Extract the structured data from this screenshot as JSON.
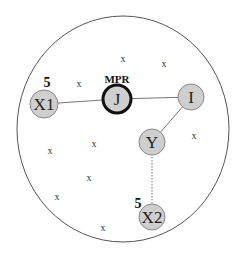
{
  "diagram": {
    "boundary": {
      "cx": 123,
      "cy": 129,
      "rx": 106,
      "ry": 113,
      "stroke": "#555555"
    },
    "nodes": [
      {
        "id": "X1",
        "label": "X1",
        "cx": 44,
        "cy": 104,
        "r": 14,
        "fill": "#cfcfcf",
        "bold": false
      },
      {
        "id": "J",
        "label": "J",
        "cx": 117,
        "cy": 99,
        "r": 14,
        "fill": "#cfcfcf",
        "bold": true
      },
      {
        "id": "I",
        "label": "I",
        "cx": 191,
        "cy": 97,
        "r": 13,
        "fill": "#cfcfcf",
        "bold": false
      },
      {
        "id": "Y",
        "label": "Y",
        "cx": 152,
        "cy": 142,
        "r": 13,
        "fill": "#cfcfcf",
        "bold": false
      },
      {
        "id": "X2",
        "label": "X2",
        "cx": 152,
        "cy": 217,
        "r": 13,
        "fill": "#cfcfcf",
        "bold": false
      }
    ],
    "edges": [
      {
        "from": "X1",
        "to": "J",
        "style": "solid"
      },
      {
        "from": "J",
        "to": "I",
        "style": "solid"
      },
      {
        "from": "I",
        "to": "Y",
        "style": "solid"
      },
      {
        "from": "Y",
        "to": "X2",
        "style": "dotted"
      }
    ],
    "annotations": [
      {
        "text": "5",
        "x": 47,
        "y": 87,
        "size": 14
      },
      {
        "text": "MPR",
        "x": 117,
        "y": 83,
        "size": 11
      },
      {
        "text": "5",
        "x": 138,
        "y": 208,
        "size": 14
      }
    ],
    "other_nodes_marker": "x",
    "other_nodes": [
      {
        "x": 123,
        "y": 62
      },
      {
        "x": 164,
        "y": 67
      },
      {
        "x": 79,
        "y": 87
      },
      {
        "x": 94,
        "y": 147
      },
      {
        "x": 50,
        "y": 154
      },
      {
        "x": 194,
        "y": 139
      },
      {
        "x": 89,
        "y": 181
      },
      {
        "x": 57,
        "y": 200
      },
      {
        "x": 103,
        "y": 231
      }
    ]
  }
}
